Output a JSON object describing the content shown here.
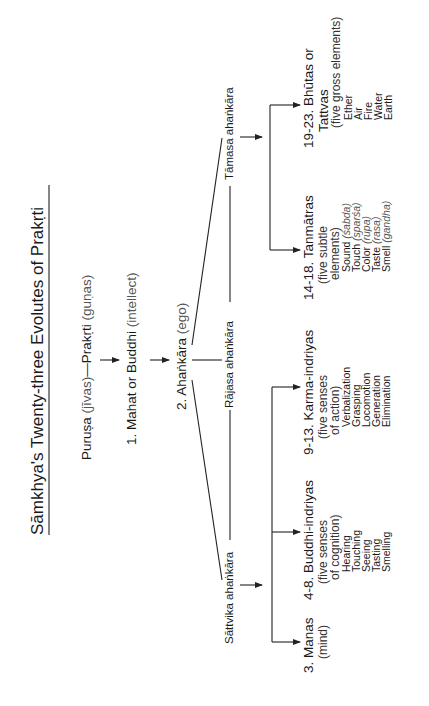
{
  "title": "Sāmkhya's Twenty-three Evolutes of Prakṛti",
  "root": {
    "purusa": "Puruṣa",
    "purusa_gloss": "(jīvas)",
    "dash": "—",
    "prakrti": "Prakṛti",
    "prakrti_gloss": "(guṇas)"
  },
  "mahat": {
    "label": "1. Mahat or Buddhi",
    "gloss": "(intellect)"
  },
  "ahankara": {
    "label": "2. Ahaṅkāra",
    "gloss": "(ego)"
  },
  "branches": {
    "tamasa": "Tāmasa ahaṅkāra",
    "rajasa": "Rājasa ahaṅkāra",
    "sattvika": "Sāttvika ahaṅkāra"
  },
  "evolutes": {
    "bhutas": {
      "line1": "19-23. Bhūtas or",
      "line2": "Tattvas",
      "gloss": "(five gross elements)",
      "items": [
        "Ether",
        "Air",
        "Fire",
        "Water",
        "Earth"
      ]
    },
    "tanmatras": {
      "line1": "14-18. Tanmātras",
      "gloss1": "(five subtle",
      "gloss2": "elements)",
      "items": [
        {
          "name": "Sound",
          "skt": "(śabda)"
        },
        {
          "name": "Touch",
          "skt": "(sparśa)"
        },
        {
          "name": "Color",
          "skt": "(rūpa)"
        },
        {
          "name": "Taste",
          "skt": "(rasa)"
        },
        {
          "name": "Smell",
          "skt": "(gandha)"
        }
      ]
    },
    "karma": {
      "line1": "9-13. Karma-indriyas",
      "gloss1": "(five senses",
      "gloss2": "of action)",
      "items": [
        "Verbalization",
        "Grasping",
        "Locomotion",
        "Generation",
        "Elimination"
      ]
    },
    "buddhi": {
      "line1": "4-8. Buddhi-indriyas",
      "gloss1": "(five senses",
      "gloss2": "of cognition)",
      "items": [
        "Hearing",
        "Touching",
        "Seeing",
        "Tasting",
        "Smelling"
      ]
    },
    "manas": {
      "line1": "3. Manas",
      "gloss": "(mind)"
    }
  }
}
